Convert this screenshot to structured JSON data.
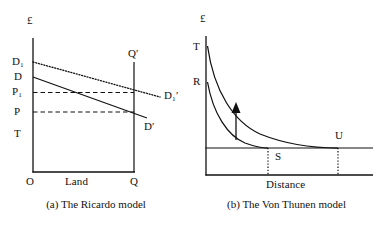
{
  "figure": {
    "panels": [
      {
        "id": "ricardo",
        "caption": "(a) The Ricardo model",
        "y_axis_label": "£",
        "x_axis_label": "Land",
        "origin_label": "O",
        "x_end_label": "Q",
        "y_tick_labels": [
          "D₁",
          "D",
          "P₁",
          "P",
          "T"
        ],
        "curve_labels": {
          "demand_shifted_top": "D₁",
          "demand_top": "D",
          "price_shifted": "P₁",
          "price": "P",
          "transfer": "T",
          "quantity_vertical": "Q′",
          "demand_shifted_end": "D₁′",
          "demand_end": "D′"
        },
        "lines": [
          {
            "name": "D1-D1prime",
            "style": "dotted",
            "from_y_label": "D₁",
            "to_label": "D₁′"
          },
          {
            "name": "D-Dprime",
            "style": "solid",
            "from_y_label": "D",
            "to_label": "D′"
          },
          {
            "name": "P1-horizontal",
            "style": "dashed",
            "from_y_label": "P₁"
          },
          {
            "name": "P-horizontal",
            "style": "dashed",
            "from_y_label": "P"
          },
          {
            "name": "Qprime-vertical",
            "style": "solid",
            "label": "Q′"
          }
        ]
      },
      {
        "id": "von-thunen",
        "caption": "(b) The Von Thunen model",
        "y_axis_label": "£",
        "x_axis_label": "Distance",
        "y_tick_labels": [
          "T",
          "R"
        ],
        "curve_labels": {
          "upper_curve_start": "T",
          "lower_curve_start": "R",
          "inner_margin": "S",
          "outer_margin": "U"
        },
        "annotations": [
          {
            "name": "shift-arrow",
            "direction": "up"
          }
        ],
        "lines": [
          {
            "name": "rent-curve-upper",
            "style": "solid",
            "from_y_label": "T",
            "to_label": "U"
          },
          {
            "name": "rent-curve-lower",
            "style": "solid",
            "from_y_label": "R",
            "to_label": "S"
          },
          {
            "name": "margin-horizontal",
            "style": "solid"
          },
          {
            "name": "S-droplines",
            "style": "dotted",
            "label": "S"
          },
          {
            "name": "U-droplines",
            "style": "dotted",
            "label": "U"
          }
        ]
      }
    ]
  },
  "colors": {
    "ink": "#111111",
    "background": "#ffffff"
  }
}
